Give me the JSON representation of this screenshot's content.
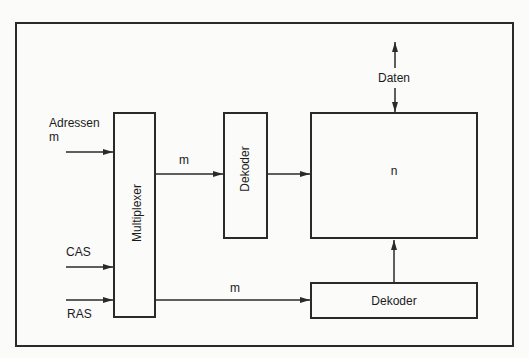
{
  "diagram": {
    "inputs": {
      "addresses_label": "Adressen",
      "addresses_width": "m",
      "cas_label": "CAS",
      "ras_label": "RAS"
    },
    "blocks": {
      "multiplexer": "Multiplexer",
      "column_decoder": "Dekoder",
      "memory_array": "n",
      "row_decoder": "Dekoder"
    },
    "signals": {
      "mux_to_decoder_width": "m",
      "mux_to_row_decoder_width": "m",
      "data_label": "Daten"
    },
    "colors": {
      "line": "#2a2a2a",
      "background": "#fbfbfa"
    }
  }
}
